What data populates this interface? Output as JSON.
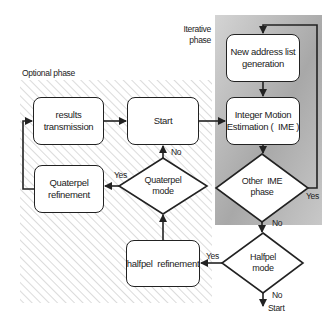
{
  "diagram": {
    "regions": {
      "optional_phase": {
        "label": "Optional   phase",
        "style": "diagonal-hatch"
      },
      "iterative_phase": {
        "label_line1": "Iterative",
        "label_line2": "phase",
        "style": "gray-gradient"
      }
    },
    "nodes": {
      "results_transmission": {
        "type": "process",
        "line1": "results",
        "line2": "transmission"
      },
      "start": {
        "type": "process",
        "line1": "Start"
      },
      "quaterpel_refinement": {
        "type": "process",
        "line1": "Quaterpel",
        "line2": "refinement"
      },
      "quaterpel_mode": {
        "type": "decision",
        "line1": "Quaterpel",
        "line2": "mode"
      },
      "halfpel_refinement": {
        "type": "process",
        "line1": "halfpel  refinement"
      },
      "new_address_list": {
        "type": "process",
        "line1": "New address list",
        "line2": "generation"
      },
      "ime": {
        "type": "process",
        "line1": "Integer Motion",
        "line2": "Estimation (  IME )"
      },
      "other_ime_phase": {
        "type": "decision",
        "line1": "Other  IME",
        "line2": "phase"
      },
      "halfpel_mode": {
        "type": "decision",
        "line1": "Halfpel",
        "line2": "mode"
      },
      "terminal_start": {
        "type": "terminal-label",
        "line1": "Start"
      }
    },
    "edge_labels": {
      "quaterpel_mode_no": "No",
      "quaterpel_mode_yes": "Yes",
      "other_ime_yes": "Yes",
      "other_ime_no": "No",
      "halfpel_mode_yes": "Yes",
      "halfpel_mode_no": "No"
    },
    "edges": [
      {
        "from": "results_transmission",
        "to": "start"
      },
      {
        "from": "start",
        "to": "ime"
      },
      {
        "from": "new_address_list",
        "to": "ime"
      },
      {
        "from": "ime",
        "to": "other_ime_phase"
      },
      {
        "from": "other_ime_phase",
        "to": "new_address_list",
        "label": "Yes"
      },
      {
        "from": "other_ime_phase",
        "to": "halfpel_mode",
        "label": "No"
      },
      {
        "from": "halfpel_mode",
        "to": "halfpel_refinement",
        "label": "Yes"
      },
      {
        "from": "halfpel_mode",
        "to": "terminal_start",
        "label": "No"
      },
      {
        "from": "halfpel_refinement",
        "to": "quaterpel_mode"
      },
      {
        "from": "quaterpel_mode",
        "to": "quaterpel_refinement",
        "label": "Yes"
      },
      {
        "from": "quaterpel_mode",
        "to": "start",
        "label": "No"
      },
      {
        "from": "quaterpel_refinement",
        "to": "results_transmission"
      }
    ],
    "colors": {
      "stroke": "#222222",
      "hatch": "#b8b8b8",
      "iterative_dark": "#9a9a9a",
      "iterative_light": "#d8d8d8"
    }
  }
}
